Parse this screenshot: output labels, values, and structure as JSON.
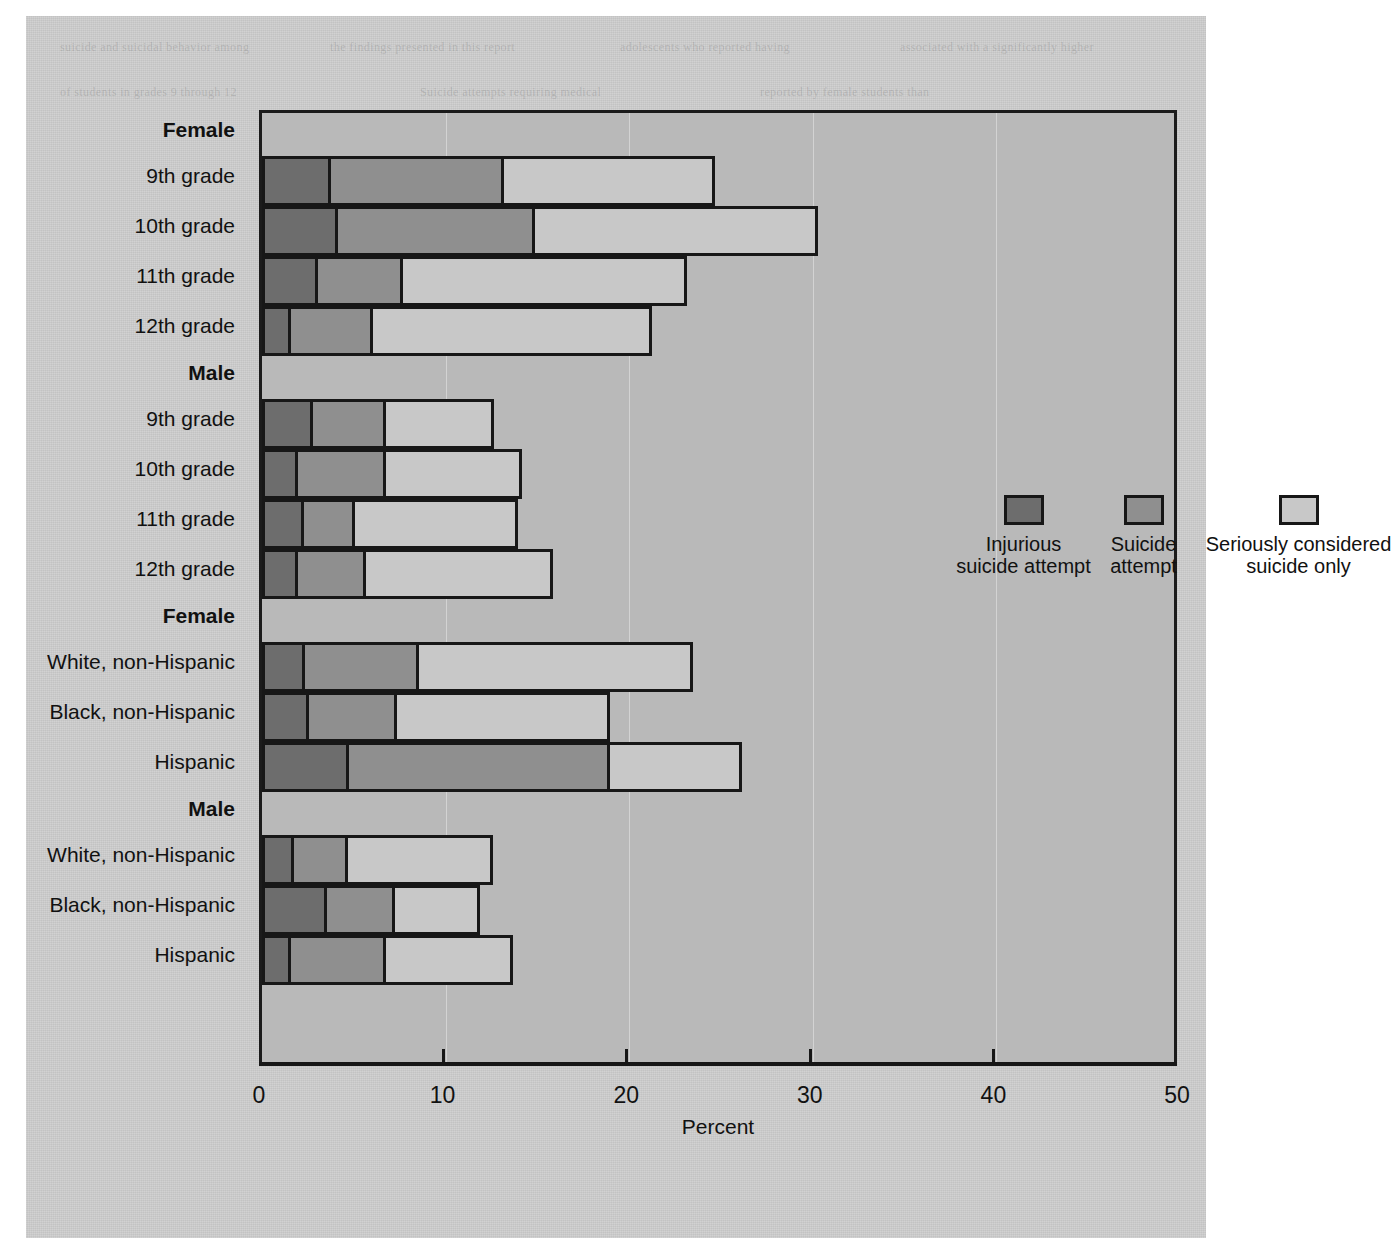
{
  "chart_data": {
    "type": "bar",
    "subtype": "stacked-horizontal",
    "title": "",
    "xlabel": "Percent",
    "ylabel": "",
    "xlim": [
      0,
      50
    ],
    "xticks": [
      0,
      10,
      20,
      30,
      40,
      50
    ],
    "grid": true,
    "legend_position": "inside-upper-right",
    "series": [
      {
        "name": "Injurious suicide attempt",
        "key": "injurious",
        "color": "#6d6d6d"
      },
      {
        "name": "Suicide attempt",
        "key": "attempt",
        "color": "#8f8f8f"
      },
      {
        "name": "Seriously considered suicide only",
        "key": "considered",
        "color": "#c8c8c8"
      }
    ],
    "groups": [
      {
        "label": "Female",
        "bold": true,
        "rows": [
          {
            "label": "9th grade",
            "injurious": 3.6,
            "attempt": 9.4,
            "considered": 11.5,
            "total": 24.5
          },
          {
            "label": "10th grade",
            "injurious": 4.0,
            "attempt": 10.7,
            "considered": 15.4,
            "total": 30.1
          },
          {
            "label": "11th grade",
            "injurious": 2.9,
            "attempt": 4.6,
            "considered": 15.5,
            "total": 23.0
          },
          {
            "label": "12th grade",
            "injurious": 1.4,
            "attempt": 4.5,
            "considered": 15.2,
            "total": 21.1
          }
        ]
      },
      {
        "label": "Male",
        "bold": true,
        "rows": [
          {
            "label": "9th grade",
            "injurious": 2.6,
            "attempt": 4.0,
            "considered": 5.9,
            "total": 12.5
          },
          {
            "label": "10th grade",
            "injurious": 1.8,
            "attempt": 4.8,
            "considered": 7.4,
            "total": 14.0
          },
          {
            "label": "11th grade",
            "injurious": 2.1,
            "attempt": 2.8,
            "considered": 8.9,
            "total": 13.8
          },
          {
            "label": "12th grade",
            "injurious": 1.8,
            "attempt": 3.7,
            "considered": 10.2,
            "total": 15.7
          }
        ]
      },
      {
        "label": "Female",
        "bold": true,
        "rows": [
          {
            "label": "White, non-Hispanic",
            "injurious": 2.2,
            "attempt": 6.2,
            "considered": 14.9,
            "total": 23.3
          },
          {
            "label": "Black, non-Hispanic",
            "injurious": 2.4,
            "attempt": 4.8,
            "considered": 11.6,
            "total": 18.8
          },
          {
            "label": "Hispanic",
            "injurious": 4.6,
            "attempt": 14.2,
            "considered": 7.2,
            "total": 26.0
          }
        ]
      },
      {
        "label": "Male",
        "bold": true,
        "rows": [
          {
            "label": "White, non-Hispanic",
            "injurious": 1.6,
            "attempt": 2.9,
            "considered": 7.9,
            "total": 12.4
          },
          {
            "label": "Black, non-Hispanic",
            "injurious": 3.4,
            "attempt": 3.7,
            "considered": 4.6,
            "total": 11.7
          },
          {
            "label": "Hispanic",
            "injurious": 1.4,
            "attempt": 5.2,
            "considered": 6.9,
            "total": 13.5
          }
        ]
      }
    ]
  },
  "axis": {
    "tick_labels": [
      "0",
      "10",
      "20",
      "30",
      "40",
      "50"
    ],
    "x_title": "Percent"
  },
  "legend": {
    "items": [
      {
        "label": "Injurious\nsuicide attempt",
        "color": "#6d6d6d"
      },
      {
        "label": "Suicide\nattempt",
        "color": "#8f8f8f"
      },
      {
        "label": "Seriously considered\nsuicide only",
        "color": "#c8c8c8"
      }
    ]
  },
  "ghost_text": {
    "lines": [
      "suicide and suicidal behavior among",
      "the findings presented in this report",
      "adolescents who reported having",
      "associated with a significantly higher",
      "of students in grades 9 through 12",
      "Suicide attempts requiring medical",
      "reported by female students than",
      "differences by race and ethnicity",
      "Hispanic students reported the",
      "highest prevalence of suicide",
      "attempts in the 12 months preceding",
      "the survey. Data are from the Youth",
      "Risk Behavior Surveillance System"
    ]
  },
  "colors": {
    "paper": "#cfcfcf",
    "plot_background": "#b9b9b9",
    "ink": "#171717",
    "segment_dark": "#6d6d6d",
    "segment_mid": "#8f8f8f",
    "segment_light": "#c8c8c8"
  }
}
